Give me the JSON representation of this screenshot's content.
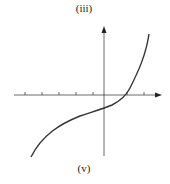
{
  "labels": {
    "top": "(iii)",
    "bottom": "(v)"
  },
  "graph": {
    "description": "Cubic-like increasing curve crossing x-axis right of origin, y-intercept below origin",
    "axis_color": "#444444",
    "curve_color": "#333333",
    "x_ticks_count": 7
  }
}
